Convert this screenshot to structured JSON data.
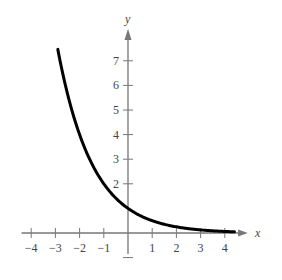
{
  "chart_data": {
    "type": "line",
    "title": "",
    "xlabel": "x",
    "ylabel": "y",
    "xlim": [
      -4.4,
      4.6
    ],
    "ylim": [
      -0.8,
      7.8
    ],
    "x_ticks": [
      -4,
      -3,
      -2,
      -1,
      1,
      2,
      3,
      4
    ],
    "y_ticks": [
      2,
      3,
      4,
      5,
      6,
      7
    ],
    "x_tick_labels": [
      "−4",
      "−3",
      "−2",
      "−1",
      "1",
      "2",
      "3",
      "4"
    ],
    "y_tick_labels": [
      "2",
      "3",
      "4",
      "5",
      "6",
      "7"
    ],
    "grid": false,
    "legend": null,
    "series": [
      {
        "name": "y = (1/2)^x",
        "x": [
          -2.9,
          -2.5,
          -2,
          -1.5,
          -1,
          -0.5,
          0,
          0.5,
          1,
          1.5,
          2,
          2.5,
          3,
          3.5,
          4,
          4.4
        ],
        "values": [
          7.46,
          5.66,
          4,
          2.83,
          2,
          1.41,
          1,
          0.71,
          0.5,
          0.35,
          0.25,
          0.18,
          0.125,
          0.09,
          0.0625,
          0.05
        ]
      }
    ],
    "colors": {
      "curve": "#000000",
      "axes": "#777777",
      "text": "#444444"
    }
  }
}
